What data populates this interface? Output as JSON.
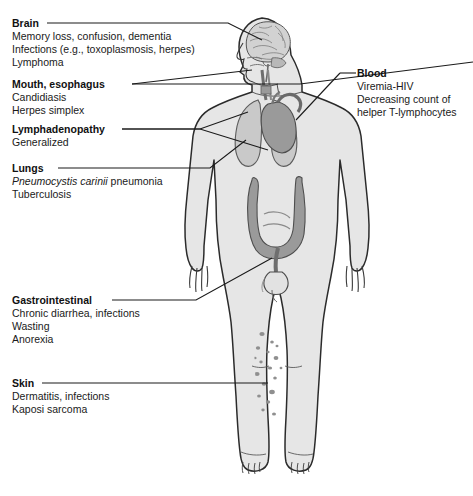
{
  "figure": {
    "colors": {
      "body_fill": "#e6e6e6",
      "body_outline": "#2b2b2b",
      "organ_fill": "#9a9a9a",
      "organ_fill_light": "#c9c9c9",
      "brain_fill": "#d2d2d2",
      "leader_line": "#1a1a1a",
      "background": "#ffffff",
      "lesion": "#8c8c8c"
    }
  },
  "labels": [
    {
      "id": "brain",
      "title": "Brain",
      "items": [
        "Memory loss, confusion, dementia",
        "Infections (e.g., toxoplasmosis, herpes)",
        "Lymphoma"
      ],
      "side": "left"
    },
    {
      "id": "mouth-esophagus",
      "title": "Mouth, esophagus",
      "items": [
        "Candidiasis",
        "Herpes simplex"
      ],
      "side": "left"
    },
    {
      "id": "lymphadenopathy",
      "title": "Lymphadenopathy",
      "items": [
        "Generalized"
      ],
      "side": "left"
    },
    {
      "id": "lungs",
      "title": "Lungs",
      "items": [
        "Pneumocystis carinii pneumonia",
        "Tuberculosis"
      ],
      "items_italic_prefix": "Pneumocystis carinii",
      "items_roman_suffix": " pneumonia",
      "side": "left"
    },
    {
      "id": "gastrointestinal",
      "title": "Gastrointestinal",
      "items": [
        "Chronic diarrhea, infections",
        "Wasting",
        "Anorexia"
      ],
      "side": "left"
    },
    {
      "id": "skin",
      "title": "Skin",
      "items": [
        "Dermatitis, infections",
        "Kaposi sarcoma"
      ],
      "side": "left"
    },
    {
      "id": "blood",
      "title": "Blood",
      "items": [
        "Viremia-HIV",
        "Decreasing count of",
        "helper T-lymphocytes"
      ],
      "side": "right"
    }
  ]
}
